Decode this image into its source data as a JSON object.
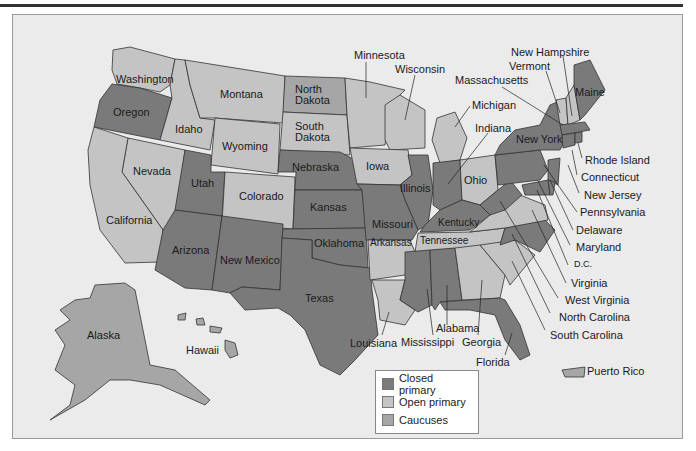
{
  "map": {
    "type": "choropleth",
    "subject": "US presidential primary types by state",
    "colors": {
      "closed_primary": "#7a7a7a",
      "open_primary": "#c4c4c4",
      "caucuses": "#a6a6a6",
      "background": "#ebebeb"
    },
    "legend": [
      {
        "label": "Closed primary",
        "color": "#7a7a7a"
      },
      {
        "label": "Open primary",
        "color": "#c4c4c4"
      },
      {
        "label": "Caucuses",
        "color": "#a6a6a6"
      }
    ],
    "labels": {
      "washington": "Washington",
      "oregon": "Oregon",
      "idaho": "Idaho",
      "montana": "Montana",
      "wyoming": "Wyoming",
      "north_dakota": "North\nDakota",
      "south_dakota": "South\nDakota",
      "nebraska": "Nebraska",
      "nevada": "Nevada",
      "california": "California",
      "utah": "Utah",
      "colorado": "Colorado",
      "kansas": "Kansas",
      "arizona": "Arizona",
      "new_mexico": "New Mexico",
      "oklahoma": "Oklahoma",
      "texas": "Texas",
      "minnesota": "Minnesota",
      "wisconsin": "Wisconsin",
      "iowa": "Iowa",
      "illinois": "Illinois",
      "missouri": "Missouri",
      "arkansas": "Arkansas",
      "louisiana": "Louisiana",
      "mississippi": "Mississippi",
      "alabama": "Alabama",
      "georgia": "Georgia",
      "florida": "Florida",
      "tennessee": "Tennessee",
      "kentucky": "Kentucky",
      "indiana": "Indiana",
      "michigan": "Michigan",
      "ohio": "Ohio",
      "new_york": "New York",
      "maine": "Maine",
      "new_hampshire": "New Hampshire",
      "vermont": "Vermont",
      "massachusetts": "Massachusetts",
      "rhode_island": "Rhode Island",
      "connecticut": "Connecticut",
      "new_jersey": "New Jersey",
      "pennsylvania": "Pennsylvania",
      "delaware": "Delaware",
      "maryland": "Maryland",
      "dc": "D.C.",
      "virginia": "Virginia",
      "west_virginia": "West Virginia",
      "north_carolina": "North Carolina",
      "south_carolina": "South Carolina",
      "alaska": "Alaska",
      "hawaii": "Hawaii",
      "puerto_rico": "Puerto Rico"
    }
  }
}
